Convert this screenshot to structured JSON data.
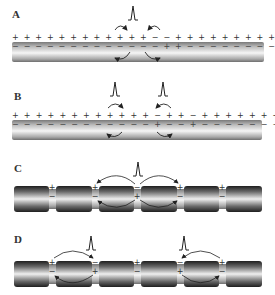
{
  "figure": {
    "panels": [
      {
        "id": "A",
        "label": "A",
        "type": "unmyelinated",
        "description": "Single action potential on unmyelinated axon; local currents spread in both directions",
        "spikes_x": [
          130
        ],
        "outside_charges": "+ + + + + + + + + + + + − − + + + + + + + + + + + + +",
        "inside_charges": "− − − − − − − − − − − − − + + − − − − − − − − − − − −"
      },
      {
        "id": "B",
        "label": "B",
        "type": "unmyelinated",
        "description": "Two action potentials propagating away from each other",
        "spikes_x": [
          113,
          162
        ],
        "outside_charges": "+ + + + + + + + + + + + − + + − + + + + + + + + + +",
        "inside_charges": "− − − − − − − − − − − − + − − + − − − − − − − − − −"
      },
      {
        "id": "C",
        "label": "C",
        "type": "myelinated",
        "description": "Saltatory conduction: depolarization at central node of Ranvier",
        "nodes_x": [
          52,
          95,
          137,
          180,
          222
        ],
        "active_node": 2,
        "spikes_x": [
          137
        ]
      },
      {
        "id": "D",
        "label": "D",
        "type": "myelinated",
        "description": "Two action potentials at separate nodes, currents jumping to adjacent nodes",
        "nodes_x": [
          52,
          95,
          137,
          180,
          222
        ],
        "active_nodes": [
          1,
          3
        ],
        "spikes_x": [
          90,
          183
        ]
      }
    ],
    "symbols": {
      "plus": "+",
      "minus": "−"
    },
    "colors": {
      "axon_light": "#f2f2f2",
      "axon_dark": "#8a8a8a",
      "myelin_dark": "#2e2e2e",
      "text": "#333333",
      "arrow": "#222222"
    }
  }
}
